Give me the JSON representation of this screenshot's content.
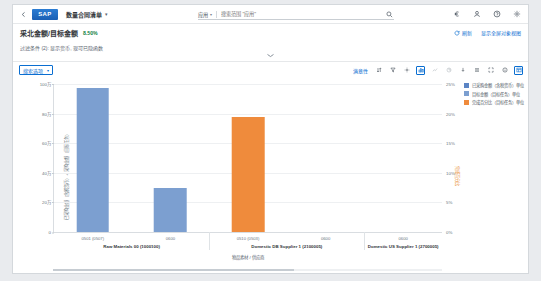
{
  "shell": {
    "back_icon": "chevron-left-icon",
    "logo_text": "SAP",
    "app_title": "数量合同清单",
    "app_title_caret": "▾",
    "icons": [
      "currency-icon",
      "user-icon",
      "help-icon",
      "settings-icon"
    ]
  },
  "search": {
    "scope_label": "应用",
    "scope_caret": "▾",
    "placeholder": "搜索范围 \"应用\"",
    "value": "",
    "go_icon": "search-icon"
  },
  "title_row": {
    "kpi_title": "采北金额/目标金额",
    "kpi_badge": "8.50%",
    "refresh_label": "刷新",
    "refresh_icon": "refresh-icon",
    "fullscreen_label": "显示全屏对象视图",
    "fullscreen_icon": "expand-icon"
  },
  "filter_row": {
    "text": "过滤条件 (2): 显示货币, 现可已隐函数"
  },
  "chart_toolbar": {
    "view_select_label": "搜索选项",
    "view_select_caret": "▾",
    "right_label": "满意性",
    "icons": [
      {
        "name": "sort-icon",
        "state": "normal"
      },
      {
        "name": "filter-icon",
        "state": "normal"
      },
      {
        "name": "settings-gear-icon",
        "state": "normal"
      },
      {
        "name": "chart-bar-icon",
        "state": "active"
      },
      {
        "name": "chart-line-icon",
        "state": "dim"
      },
      {
        "name": "chart-pie-icon",
        "state": "dim"
      },
      {
        "name": "drill-down-icon",
        "state": "normal"
      },
      {
        "name": "legend-icon",
        "state": "normal"
      },
      {
        "name": "fullscreen-icon",
        "state": "normal"
      },
      {
        "name": "info-icon",
        "state": "normal"
      },
      {
        "name": "table-view-icon",
        "state": "active"
      }
    ]
  },
  "chart_data": {
    "type": "bar",
    "title": "",
    "xlabel": "物品素材 / 供应商",
    "ylabel": "已采购金额（含税货币）+ 采购金额（目标任务）",
    "ylabel_right": "完成百分比",
    "ylim": [
      0,
      1000000
    ],
    "ylim_right": [
      0,
      25
    ],
    "grid": true,
    "legend_position": "top-right",
    "y_ticks": [
      "100万",
      "80万",
      "60万",
      "40万",
      "20万",
      "0"
    ],
    "y_tick_values": [
      1000000,
      800000,
      600000,
      400000,
      200000,
      0
    ],
    "y_ticks_right": [
      "25%",
      "20%",
      "15%",
      "10%",
      "5%",
      "0%"
    ],
    "y_tick_values_right": [
      25,
      20,
      15,
      10,
      5,
      0
    ],
    "groups": [
      {
        "group_label": "Raw Materials 00 (1000100)",
        "categories": [
          "0501 (0507)",
          "0600"
        ]
      },
      {
        "group_label": "Domestic DB Supplier 1 (2100005)",
        "categories": [
          "0510 (0503)",
          "0600"
        ]
      },
      {
        "group_label": "Domestic US Supplier 1 (2700005)",
        "categories": [
          "0600"
        ]
      }
    ],
    "series": [
      {
        "name": "已采购金额（含税货币）单位",
        "color": "#7c9fd0",
        "axis": "left",
        "points": [
          {
            "group": 0,
            "category": "0501 (0507)",
            "value": 970000
          },
          {
            "group": 0,
            "category": "0600",
            "value": 300000
          }
        ]
      },
      {
        "name": "目标金额（目标任务）单位",
        "color": "#5b84c4",
        "axis": "left",
        "points": []
      },
      {
        "name": "完成百分比（目标任务）单位",
        "color": "#ef8b3c",
        "axis": "right",
        "points": [
          {
            "group": 1,
            "category": "0510 (0503)",
            "value": 19.5
          }
        ]
      }
    ]
  },
  "legend": [
    {
      "label": "已采购金额（含税货币）单位",
      "color": "#5b84c4"
    },
    {
      "label": "目标金额（目标任务）单位",
      "color": "#7c9fd0"
    },
    {
      "label": "完成百分比（目标任务）单位",
      "color": "#ef8b3c"
    }
  ],
  "colors": {
    "brand_blue": "#0a6ed1",
    "bar_blue": "#7c9fd0",
    "bar_orange": "#ef8b3c",
    "success_green": "#107e3e"
  }
}
